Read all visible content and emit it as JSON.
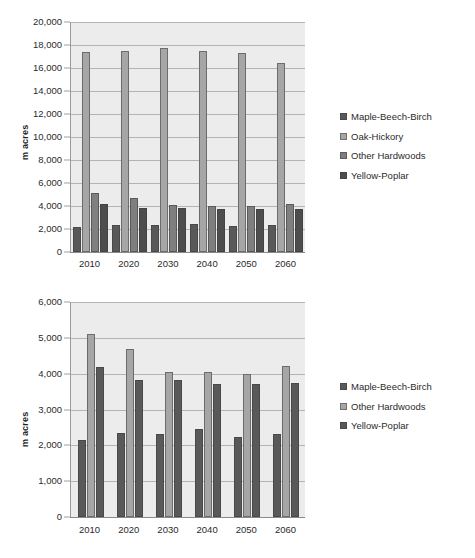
{
  "chart_data": [
    {
      "id": "top",
      "type": "bar",
      "title": "",
      "xlabel": "",
      "ylabel": "m acres",
      "ylim": [
        0,
        20000
      ],
      "ytick_step": 2000,
      "ytick_labels": [
        "20,000",
        "18,000",
        "16,000",
        "14,000",
        "12,000",
        "10,000",
        "8,000",
        "6,000",
        "4,000",
        "2,000",
        "0"
      ],
      "ytick_values": [
        20000,
        18000,
        16000,
        14000,
        12000,
        10000,
        8000,
        6000,
        4000,
        2000,
        0
      ],
      "grid": true,
      "legend_position": "right",
      "categories": [
        "2010",
        "2020",
        "2030",
        "2040",
        "2050",
        "2060"
      ],
      "series": [
        {
          "name": "Maple-Beech-Birch",
          "color": "#595959",
          "values": [
            2150,
            2350,
            2330,
            2450,
            2230,
            2330
          ]
        },
        {
          "name": "Oak-Hickory",
          "color": "#a6a6a6",
          "values": [
            17350,
            17450,
            17750,
            17450,
            17300,
            16450
          ]
        },
        {
          "name": "Other Hardwoods",
          "color": "#7f7f7f",
          "values": [
            5100,
            4700,
            4060,
            4040,
            3980,
            4210
          ]
        },
        {
          "name": "Yellow-Poplar",
          "color": "#4d4d4d",
          "values": [
            4200,
            3820,
            3810,
            3700,
            3700,
            3740
          ]
        }
      ]
    },
    {
      "id": "bottom",
      "type": "bar",
      "title": "",
      "xlabel": "",
      "ylabel": "m acres",
      "ylim": [
        0,
        6000
      ],
      "ytick_step": 1000,
      "ytick_labels": [
        "6,000",
        "5,000",
        "4,000",
        "3,000",
        "2,000",
        "1,000",
        "0"
      ],
      "ytick_values": [
        6000,
        5000,
        4000,
        3000,
        2000,
        1000,
        0
      ],
      "grid": true,
      "legend_position": "right",
      "categories": [
        "2010",
        "2020",
        "2030",
        "2040",
        "2050",
        "2060"
      ],
      "series": [
        {
          "name": "Maple-Beech-Birch",
          "color": "#595959",
          "values": [
            2150,
            2350,
            2330,
            2450,
            2230,
            2330
          ]
        },
        {
          "name": "Other Hardwoods",
          "color": "#a6a6a6",
          "values": [
            5100,
            4700,
            4060,
            4040,
            3980,
            4210
          ]
        },
        {
          "name": "Yellow-Poplar",
          "color": "#595959",
          "values": [
            4200,
            3820,
            3810,
            3700,
            3700,
            3740
          ]
        }
      ]
    }
  ]
}
